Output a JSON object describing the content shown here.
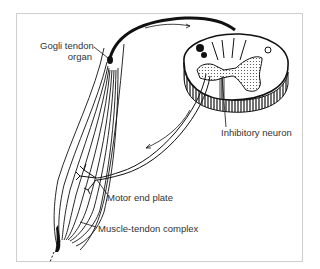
{
  "diagram": {
    "labels": {
      "gogli_tendon_organ_line1": "Gogli tendon",
      "gogli_tendon_organ_line2": "organ",
      "inhibitory_neuron": "Inhibitory neuron",
      "motor_end_plate": "Motor end plate",
      "muscle_tendon_complex": "Muscle-tendon complex"
    },
    "colors": {
      "ink": "#111111",
      "label_text": "#333333",
      "frame_border": "#cfcfcf",
      "stipple": "#555555"
    }
  }
}
